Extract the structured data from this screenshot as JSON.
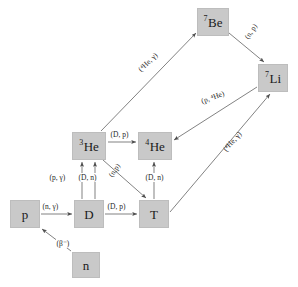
{
  "diagram": {
    "type": "reaction-network",
    "background_color": "#ffffff",
    "box_fill_color": "#c9c9c9",
    "box_border_color": "#bdbdbd",
    "arrow_color": "#555555",
    "text_color": "#1f1f1f"
  },
  "nuclides": [
    {
      "id": "n",
      "label": "n",
      "superscript": "",
      "x": 72,
      "y": 252,
      "w": 28,
      "h": 26
    },
    {
      "id": "p",
      "label": "p",
      "superscript": "",
      "x": 10,
      "y": 200,
      "w": 30,
      "h": 28
    },
    {
      "id": "D",
      "label": "D",
      "superscript": "",
      "x": 74,
      "y": 200,
      "w": 30,
      "h": 28
    },
    {
      "id": "T",
      "label": "T",
      "superscript": "",
      "x": 139,
      "y": 200,
      "w": 30,
      "h": 28
    },
    {
      "id": "He3",
      "label": "He",
      "superscript": "3",
      "x": 72,
      "y": 132,
      "w": 34,
      "h": 28
    },
    {
      "id": "He4",
      "label": "He",
      "superscript": "4",
      "x": 138,
      "y": 132,
      "w": 34,
      "h": 28
    },
    {
      "id": "Be7",
      "label": "Be",
      "superscript": "7",
      "x": 197,
      "y": 8,
      "w": 32,
      "h": 28
    },
    {
      "id": "Li7",
      "label": "Li",
      "superscript": "7",
      "x": 258,
      "y": 64,
      "w": 30,
      "h": 28
    }
  ],
  "reactions": [
    {
      "id": "n-to-p",
      "from": "n",
      "to": "p",
      "label": "(β⁻)",
      "label_x": 56,
      "label_y": 239,
      "rotation": 0
    },
    {
      "id": "p-to-D",
      "from": "p",
      "to": "D",
      "label": "(n, γ)",
      "label_x": 42,
      "label_y": 203,
      "rotation": 0
    },
    {
      "id": "D-to-T",
      "from": "D",
      "to": "T",
      "label": "(D, p)",
      "label_x": 107,
      "label_y": 203,
      "rotation": 0
    },
    {
      "id": "D-to-He3-pg",
      "from": "D",
      "to": "He3",
      "label": "(p, γ)",
      "label_x": 51,
      "label_y": 174,
      "rotation": 0
    },
    {
      "id": "D-to-He3-Dn",
      "from": "D",
      "to": "He3",
      "label": "(D, n)",
      "label_x": 79,
      "label_y": 174,
      "rotation": 0
    },
    {
      "id": "He3-to-T",
      "from": "He3",
      "to": "T",
      "label": "(n,p)",
      "label_x": 115,
      "label_y": 174,
      "rotation": -56
    },
    {
      "id": "T-to-He4",
      "from": "T",
      "to": "He4",
      "label": "(D, n)",
      "label_x": 146,
      "label_y": 174,
      "rotation": 0
    },
    {
      "id": "He3-to-He4",
      "from": "He3",
      "to": "He4",
      "label": "(D, p)",
      "label_x": 111,
      "label_y": 131,
      "rotation": 0
    },
    {
      "id": "He3-to-Be7",
      "from": "He3",
      "to": "Be7",
      "label": "(⁴He, γ)",
      "label_x": 141,
      "label_y": 68,
      "rotation": -44
    },
    {
      "id": "Be7-to-Li7",
      "from": "Be7",
      "to": "Li7",
      "label": "(n, p)",
      "label_x": 248,
      "label_y": 36,
      "rotation": -56
    },
    {
      "id": "Li7-to-He4",
      "from": "Li7",
      "to": "He4",
      "label": "(p, ⁴He)",
      "label_x": 203,
      "label_y": 98,
      "rotation": -20
    },
    {
      "id": "T-to-Li7",
      "from": "T",
      "to": "Li7",
      "label": "(⁴He, γ)",
      "label_x": 226,
      "label_y": 148,
      "rotation": -48
    }
  ]
}
